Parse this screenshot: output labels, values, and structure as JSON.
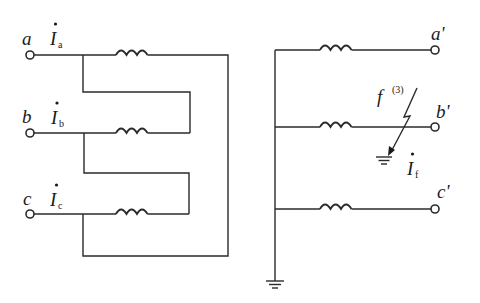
{
  "diagram": {
    "title": "",
    "left_winding": {
      "terminals": [
        {
          "label": "a",
          "current": "I",
          "current_sub": "a"
        },
        {
          "label": "b",
          "current": "I",
          "current_sub": "b"
        },
        {
          "label": "c",
          "current": "I",
          "current_sub": "c"
        }
      ],
      "connection": "delta"
    },
    "right_winding": {
      "terminals": [
        {
          "label": "a'"
        },
        {
          "label": "b'"
        },
        {
          "label": "c'"
        }
      ],
      "connection": "grounded-wye"
    },
    "fault": {
      "label": "f",
      "superscript": "(3)",
      "current": "I",
      "current_sub": "f"
    },
    "icons": [
      "terminal-circle",
      "inductor-coil",
      "ground-symbol",
      "fault-lightning-arrow"
    ],
    "colors": {
      "line": "#2a2a2a",
      "background": "#ffffff"
    }
  }
}
